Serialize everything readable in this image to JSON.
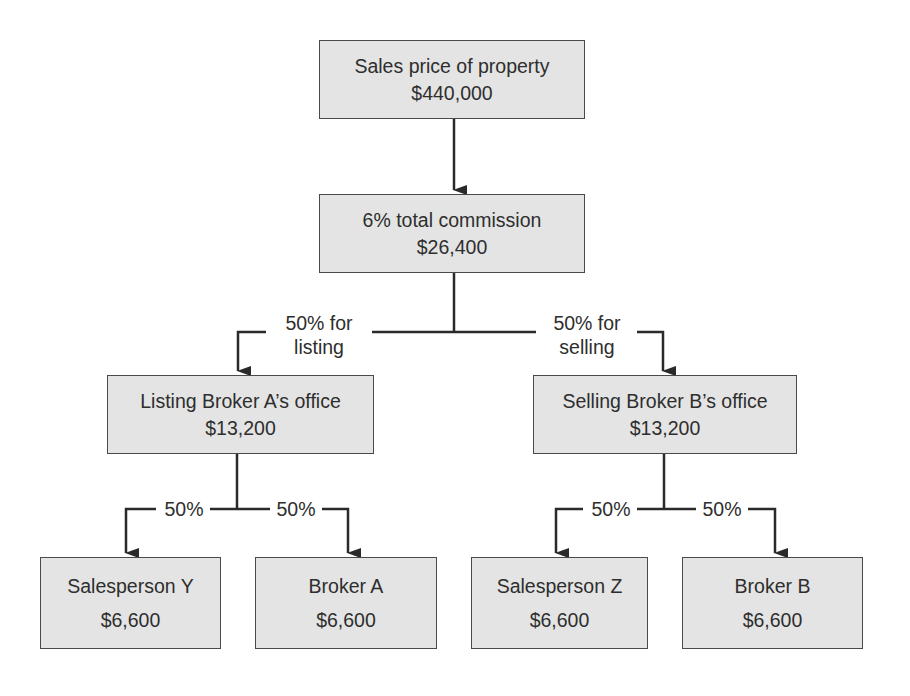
{
  "diagram": {
    "nodes": {
      "sales_price": {
        "title": "Sales price of property",
        "amount": "$440,000"
      },
      "total_commission": {
        "title": "6% total commission",
        "amount": "$26,400"
      },
      "listing_office": {
        "title": "Listing Broker A’s office",
        "amount": "$13,200"
      },
      "selling_office": {
        "title": "Selling Broker B’s office",
        "amount": "$13,200"
      },
      "salesperson_y": {
        "title": "Salesperson Y",
        "amount": "$6,600"
      },
      "broker_a": {
        "title": "Broker A",
        "amount": "$6,600"
      },
      "salesperson_z": {
        "title": "Salesperson Z",
        "amount": "$6,600"
      },
      "broker_b": {
        "title": "Broker B",
        "amount": "$6,600"
      }
    },
    "edge_labels": {
      "listing_line1": "50% for",
      "listing_line2": "listing",
      "selling_line1": "50% for",
      "selling_line2": "selling",
      "listing_to_salesperson_y": "50%",
      "listing_to_broker_a": "50%",
      "selling_to_salesperson_z": "50%",
      "selling_to_broker_b": "50%"
    },
    "colors": {
      "box_fill": "#e4e4e4",
      "box_border": "#4a4a4a",
      "line": "#2a2a2a"
    }
  }
}
